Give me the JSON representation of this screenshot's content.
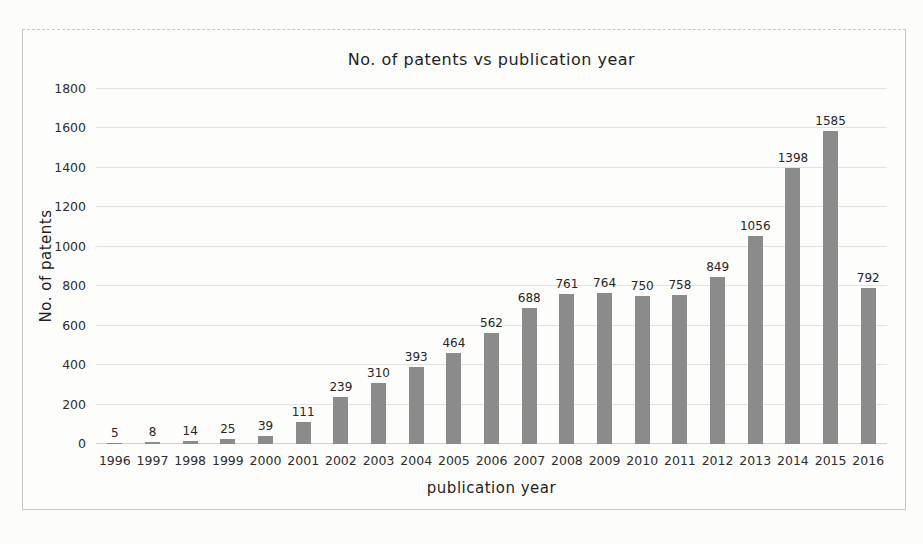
{
  "figure": {
    "title": "No. of patents vs publication year",
    "xlabel": "publication year",
    "ylabel": "No. of patents"
  },
  "chart_data": {
    "type": "bar",
    "title": "No. of patents vs publication year",
    "xlabel": "publication year",
    "ylabel": "No. of patents",
    "categories": [
      "1996",
      "1997",
      "1998",
      "1999",
      "2000",
      "2001",
      "2002",
      "2003",
      "2004",
      "2005",
      "2006",
      "2007",
      "2008",
      "2009",
      "2010",
      "2011",
      "2012",
      "2013",
      "2014",
      "2015",
      "2016"
    ],
    "values": [
      5,
      8,
      14,
      25,
      39,
      111,
      239,
      310,
      393,
      464,
      562,
      688,
      761,
      764,
      750,
      758,
      849,
      1056,
      1398,
      1585,
      792
    ],
    "value_labels_shown": true,
    "ylim": [
      0,
      1800
    ],
    "yticks": [
      0,
      200,
      400,
      600,
      800,
      1000,
      1200,
      1400,
      1600,
      1800
    ],
    "grid": "horizontal",
    "legend": "none"
  },
  "colors": {
    "bar": "#8b8b8b",
    "page_background": "#fcfcfa",
    "figure_background": "#fdfdfc",
    "figure_border": "#c6c6c2",
    "gridline": "#e3e3de",
    "text": "#1f1f1f",
    "tick_text": "#2d2d2d"
  }
}
